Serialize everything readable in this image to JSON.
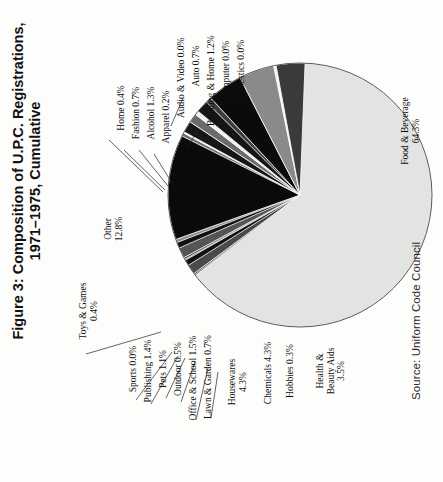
{
  "title": "Figure 3: Composition of U.P.C. Registrations,\n1971–1975, Cumulative",
  "source": "Source: Uniform Code Council",
  "chart_data": {
    "type": "pie",
    "title": "Figure 3: Composition of U.P.C. Registrations, 1971–1975, Cumulative",
    "subtitle": "",
    "source": "Source: Uniform Code Council",
    "xlabel": "",
    "ylabel": "",
    "legend_position": "none (direct slice labels with leader lines)",
    "grid": false,
    "units": "percent of U.P.C. registrations",
    "start_angle_deg": 90,
    "direction": "clockwise",
    "categories": [
      "Food & Beverage",
      "Domestics",
      "Computer",
      "Building & Home",
      "Auto",
      "Audio & Video",
      "Apparel",
      "Alcohol",
      "Fashion",
      "Home",
      "Other",
      "Toys & Games",
      "Sports",
      "Publishing",
      "Pets",
      "Outdoor",
      "Office & School",
      "Lawn & Garden",
      "Housewares",
      "Chemicals",
      "Hobbies",
      "Health & Beauty Aids"
    ],
    "values": [
      64.3,
      0.0,
      0.0,
      1.2,
      0.7,
      0.0,
      0.2,
      1.3,
      0.7,
      0.4,
      12.8,
      0.4,
      0.0,
      1.4,
      1.1,
      0.5,
      1.5,
      0.7,
      4.3,
      4.3,
      0.3,
      3.5
    ],
    "slices": [
      {
        "label": "Food & Beverage",
        "value": 64.3,
        "text": "Food & Beverage\n64.3%",
        "color": "#e3e3e1"
      },
      {
        "label": "Domestics",
        "value": 0.0,
        "text": "Domestics 0.0%",
        "color": "#777777"
      },
      {
        "label": "Computer",
        "value": 0.0,
        "text": "Computer 0.0%",
        "color": "#111111"
      },
      {
        "label": "Building & Home",
        "value": 1.2,
        "text": "Building & Home 1.2%",
        "color": "#4a4a4a"
      },
      {
        "label": "Auto",
        "value": 0.7,
        "text": "Auto 0.7%",
        "color": "#111111"
      },
      {
        "label": "Audio & Video",
        "value": 0.0,
        "text": "Audio & Video 0.0%",
        "color": "#9a9a9a"
      },
      {
        "label": "Apparel",
        "value": 0.2,
        "text": "Apparel 0.2%",
        "color": "#2a2a2a"
      },
      {
        "label": "Alcohol",
        "value": 1.3,
        "text": "Alcohol 1.3%",
        "color": "#555555"
      },
      {
        "label": "Fashion",
        "value": 0.7,
        "text": "Fashion 0.7%",
        "color": "#111111"
      },
      {
        "label": "Home",
        "value": 0.4,
        "text": "Home 0.4%",
        "color": "#8d8d8d"
      },
      {
        "label": "Other",
        "value": 12.8,
        "text": "Other\n12.8%",
        "color": "#0a0a0a"
      },
      {
        "label": "Toys & Games",
        "value": 0.4,
        "text": "Toys & Games\n0.4%",
        "color": "#6f6f6f"
      },
      {
        "label": "Sports",
        "value": 0.0,
        "text": "Sports 0.0%",
        "color": "#f2f2f0"
      },
      {
        "label": "Publishing",
        "value": 1.4,
        "text": "Publishing 1.4%",
        "color": "#171717"
      },
      {
        "label": "Pets",
        "value": 1.1,
        "text": "Pets 1.1%",
        "color": "#6b6b6b"
      },
      {
        "label": "Outdoor",
        "value": 0.5,
        "text": "Outdoor 0.5%",
        "color": "#f2f2f0"
      },
      {
        "label": "Office & School",
        "value": 1.5,
        "text": "Office & School 1.5%",
        "color": "#151515"
      },
      {
        "label": "Lawn & Garden",
        "value": 0.7,
        "text": "Lawn & Garden 0.7%",
        "color": "#3d3d3d"
      },
      {
        "label": "Housewares",
        "value": 4.3,
        "text": "Housewares\n4.3%",
        "color": "#0b0b0b"
      },
      {
        "label": "Chemicals",
        "value": 4.3,
        "text": "Chemicals 4.3%",
        "color": "#8a8a8a"
      },
      {
        "label": "Hobbies",
        "value": 0.3,
        "text": "Hobbies 0.3%",
        "color": "#f4f4f2"
      },
      {
        "label": "Health & Beauty Aids",
        "value": 3.5,
        "text": "Health &\nBeauty Aids\n3.5%",
        "color": "#3a3a3a"
      }
    ]
  }
}
